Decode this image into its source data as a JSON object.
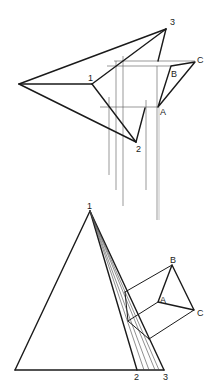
{
  "figure": {
    "colors": {
      "line": "#1a1a1a",
      "construction": "#555555",
      "background": "#ffffff"
    }
  },
  "top_view": {
    "labels": {
      "p1": "1",
      "p2": "2",
      "p3": "3",
      "A": "A",
      "B": "B",
      "C": "C"
    },
    "points": {
      "apex_left": [
        19,
        84
      ],
      "p1": [
        92,
        84
      ],
      "p2": [
        136,
        142
      ],
      "p3": [
        166,
        29
      ],
      "A": [
        158,
        107
      ],
      "B": [
        171,
        66
      ],
      "C": [
        195,
        62
      ]
    }
  },
  "front_view": {
    "labels": {
      "p1": "1",
      "p2": "2",
      "p3": "3",
      "A": "A",
      "B": "B",
      "C": "C"
    },
    "points": {
      "apex": [
        90,
        211
      ],
      "base_left": [
        15,
        370
      ],
      "p2": [
        137,
        370
      ],
      "p3": [
        164,
        370
      ],
      "A": [
        158,
        302
      ],
      "B": [
        172,
        265
      ],
      "C": [
        194,
        310
      ]
    },
    "fan_line_base_x": [
      144,
      149,
      155,
      159
    ]
  }
}
